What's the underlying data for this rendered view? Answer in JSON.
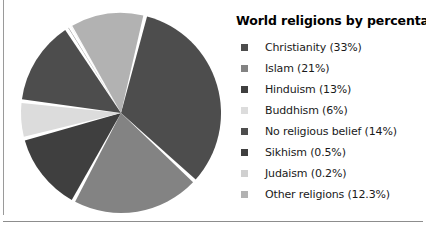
{
  "chart_data": {
    "type": "pie",
    "title": "World religions by percentage",
    "xlabel": "",
    "ylabel": "",
    "legend_position": "right",
    "grid": false,
    "start_angle_deg": -76,
    "direction": "clockwise",
    "explode_gap_deg": 2.2,
    "categories": [
      "Christianity",
      "Islam",
      "Hinduism",
      "Buddhism",
      "No religious belief",
      "Sikhism",
      "Judaism",
      "Other religions"
    ],
    "values": [
      33,
      21,
      13,
      6,
      14,
      0.5,
      0.2,
      12.3
    ],
    "value_suffix": "%",
    "colors": [
      "#4d4d4d",
      "#838383",
      "#3f3f3f",
      "#dcdcdc",
      "#4d4d4d",
      "#3f3f3f",
      "#d0d0d0",
      "#b2b2b2"
    ],
    "slices": [
      {
        "label": "Christianity",
        "value": 33,
        "display": "Christianity (33%)",
        "color": "#4d4d4d"
      },
      {
        "label": "Islam",
        "value": 21,
        "display": "Islam (21%)",
        "color": "#838383"
      },
      {
        "label": "Hinduism",
        "value": 13,
        "display": "Hinduism (13%)",
        "color": "#3f3f3f"
      },
      {
        "label": "Buddhism",
        "value": 6,
        "display": "Buddhism (6%)",
        "color": "#dcdcdc"
      },
      {
        "label": "No religious belief",
        "value": 14,
        "display": "No religious belief (14%)",
        "color": "#4d4d4d"
      },
      {
        "label": "Sikhism",
        "value": 0.5,
        "display": "Sikhism (0.5%)",
        "color": "#3f3f3f"
      },
      {
        "label": "Judaism",
        "value": 0.2,
        "display": "Judaism (0.2%)",
        "color": "#d0d0d0"
      },
      {
        "label": "Other religions",
        "value": 12.3,
        "display": "Other religions (12.3%)",
        "color": "#b2b2b2"
      }
    ]
  },
  "legend": {
    "title": "World religions by percentage",
    "items": [
      {
        "label": "Christianity (33%)",
        "color": "#4d4d4d"
      },
      {
        "label": "Islam (21%)",
        "color": "#838383"
      },
      {
        "label": "Hinduism (13%)",
        "color": "#3f3f3f"
      },
      {
        "label": "Buddhism (6%)",
        "color": "#dcdcdc"
      },
      {
        "label": "No religious belief (14%)",
        "color": "#4d4d4d"
      },
      {
        "label": "Sikhism (0.5%)",
        "color": "#3f3f3f"
      },
      {
        "label": "Judaism (0.2%)",
        "color": "#d0d0d0"
      },
      {
        "label": "Other religions (12.3%)",
        "color": "#b2b2b2"
      }
    ]
  },
  "figure": {
    "background": "#ffffff",
    "rule_color": "#8d8d8d"
  }
}
